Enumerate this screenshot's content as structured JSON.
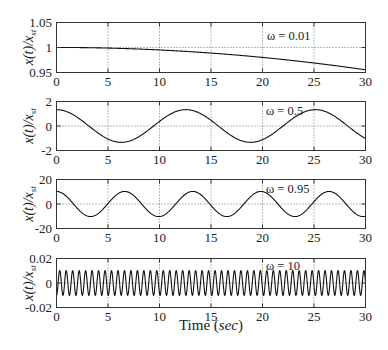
{
  "chart_data": {
    "type": "line",
    "title": "",
    "layout": {
      "rows": 4,
      "cols": 1,
      "shared_x": true
    },
    "x_axis": {
      "label": {
        "prefix": "Time (",
        "unit": "sec",
        "suffix": ")"
      },
      "range": [
        0,
        30
      ],
      "ticks": [
        0,
        5,
        10,
        15,
        20,
        25,
        30
      ],
      "tick_labels": [
        "0",
        "5",
        "10",
        "15",
        "20",
        "25",
        "30"
      ]
    },
    "y_axis_label": {
      "text": "x(t)/x",
      "subscript": "st"
    },
    "grid": {
      "x": true,
      "y": true,
      "style": "dotted"
    },
    "legend": null,
    "sample_t": [
      0,
      1,
      2,
      3,
      4,
      5,
      6,
      7,
      8,
      9,
      10,
      11,
      12,
      13,
      14,
      15,
      16,
      17,
      18,
      19,
      20,
      21,
      22,
      23,
      24,
      25,
      26,
      27,
      28,
      29,
      30
    ],
    "subplots": [
      {
        "annotation": "ω = 0.01",
        "omega": 0.01,
        "waveform": {
          "kind": "cosine",
          "amplitude": 1.0001,
          "angular_frequency": 0.01
        },
        "y_axis": {
          "range": [
            0.95,
            1.05
          ],
          "ticks": [
            0.95,
            1,
            1.05
          ],
          "tick_labels": [
            "0.95",
            "1",
            "1.05"
          ]
        },
        "values": [
          1.0001,
          1.0,
          0.9999,
          0.9997,
          0.9993,
          0.9989,
          0.9983,
          0.9977,
          0.9969,
          0.9961,
          0.9951,
          0.9941,
          0.9929,
          0.9917,
          0.9903,
          0.9889,
          0.9873,
          0.9857,
          0.9839,
          0.9821,
          0.9802,
          0.9781,
          0.976,
          0.9738,
          0.9714,
          0.969,
          0.9665,
          0.9639,
          0.9612,
          0.9583,
          0.9554
        ]
      },
      {
        "annotation": "ω = 0.5",
        "omega": 0.5,
        "waveform": {
          "kind": "cosine",
          "amplitude": 1.3333,
          "angular_frequency": 0.5
        },
        "y_axis": {
          "range": [
            -2,
            2
          ],
          "ticks": [
            -2,
            0,
            2
          ],
          "tick_labels": [
            "-2",
            "0",
            "2"
          ]
        },
        "values": [
          1.333,
          1.17,
          0.72,
          0.094,
          -0.555,
          -1.068,
          -1.32,
          -1.249,
          -0.872,
          -0.281,
          0.378,
          0.945,
          1.28,
          1.302,
          1.005,
          0.462,
          -0.194,
          -0.803,
          -1.215,
          -1.33,
          -1.119,
          -0.634,
          0.006,
          0.644,
          1.125,
          1.33,
          1.21,
          0.793,
          0.182,
          -0.468,
          -1.013
        ]
      },
      {
        "annotation": "ω = 0.95",
        "omega": 0.95,
        "waveform": {
          "kind": "cosine",
          "amplitude": 10.256,
          "angular_frequency": 0.95
        },
        "y_axis": {
          "range": [
            -20,
            20
          ],
          "ticks": [
            -20,
            0,
            20
          ],
          "tick_labels": [
            "-20",
            "0",
            "20"
          ]
        },
        "values": [
          10.26,
          5.97,
          -3.32,
          -9.82,
          -8.11,
          0.39,
          8.56,
          9.57,
          2.58,
          -6.57,
          -10.23,
          -5.32,
          4.04,
          10.02,
          7.62,
          -1.15,
          -8.96,
          -9.27,
          -1.83,
          7.15,
          10.14,
          4.65,
          -4.74,
          -10.15,
          -7.08,
          1.92,
          9.31,
          8.91,
          1.06,
          -7.68,
          -10.0
        ]
      },
      {
        "annotation": "ω = 10",
        "omega": 10,
        "waveform": {
          "kind": "cosine",
          "amplitude": -0.0101,
          "angular_frequency": 10
        },
        "y_axis": {
          "range": [
            -0.02,
            0.02
          ],
          "ticks": [
            -0.02,
            0,
            0.02
          ],
          "tick_labels": [
            "-0.02",
            "0",
            "0.02"
          ]
        },
        "samples_one_period": {
          "t": [
            0,
            0.157,
            0.314,
            0.471,
            0.628
          ],
          "y": [
            -0.0101,
            0,
            0.0101,
            0,
            -0.0101
          ]
        }
      }
    ],
    "colors": {
      "line": "#111111",
      "axes": "#333333",
      "grid": "#555555",
      "background": "#ffffff"
    }
  }
}
